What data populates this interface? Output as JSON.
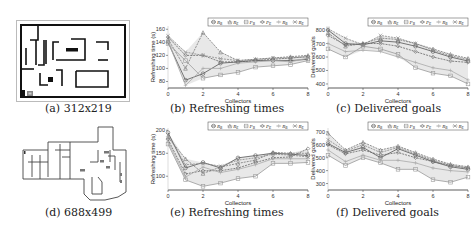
{
  "figure": {
    "panels": [
      {
        "id": "a",
        "caption": "(a) 312x219",
        "type": "map"
      },
      {
        "id": "b",
        "caption": "(b) Refreshing times",
        "type": "chart"
      },
      {
        "id": "c",
        "caption": "(c) Delivered goals",
        "type": "chart"
      },
      {
        "id": "d",
        "caption": "(d) 688x499",
        "type": "map"
      },
      {
        "id": "e",
        "caption": "(e) Refreshing times",
        "type": "chart"
      },
      {
        "id": "f",
        "caption": "(f) Delivered goals",
        "type": "chart"
      }
    ]
  },
  "legend": {
    "entries": [
      "R_B",
      "R_E",
      "P_B",
      "P_E",
      "R_B",
      "R_E"
    ],
    "display": [
      "R",
      "R",
      "P",
      "P",
      "R",
      "R"
    ],
    "subs": [
      "B",
      "E",
      "B",
      "E",
      "B",
      "E"
    ],
    "markers": [
      "circle",
      "triangle",
      "square",
      "diamond",
      "plus",
      "cross"
    ]
  },
  "colors": {
    "axis": "#333333",
    "band": "#bdbdbd",
    "series": [
      "#555555",
      "#777777",
      "#999999",
      "#666666",
      "#aaaaaa",
      "#888888"
    ]
  },
  "chart_data": [
    {
      "id": "b",
      "type": "line",
      "title": "Refreshing times",
      "xlabel": "Collectors",
      "ylabel": "Refreshing time (s)",
      "x": [
        0,
        1,
        2,
        3,
        4,
        5,
        6,
        7,
        8
      ],
      "xticks": [
        0,
        2,
        4,
        6,
        8
      ],
      "yticks": [
        80,
        100,
        120,
        140,
        160
      ],
      "ylim": [
        70,
        165
      ],
      "legend_position": "top-right",
      "grid": false,
      "series": [
        {
          "name": "R_B",
          "values": [
            140,
            82,
            92,
            108,
            110,
            112,
            112,
            112,
            114
          ]
        },
        {
          "name": "R_E",
          "values": [
            145,
            100,
            155,
            125,
            112,
            114,
            116,
            118,
            120
          ]
        },
        {
          "name": "P_B",
          "values": [
            138,
            112,
            85,
            90,
            94,
            102,
            104,
            106,
            112
          ]
        },
        {
          "name": "P_E",
          "values": [
            148,
            120,
            120,
            110,
            110,
            112,
            114,
            116,
            118
          ]
        },
        {
          "name": "R_B",
          "values": [
            142,
            74,
            100,
            100,
            108,
            110,
            112,
            110,
            116
          ]
        },
        {
          "name": "R_E",
          "values": [
            150,
            125,
            120,
            115,
            112,
            114,
            116,
            116,
            118
          ]
        }
      ]
    },
    {
      "id": "c",
      "type": "line",
      "title": "Delivered goals",
      "xlabel": "Collectors",
      "ylabel": "Delivered goals",
      "x": [
        0,
        1,
        2,
        3,
        4,
        5,
        6,
        7,
        8
      ],
      "xticks": [
        0,
        2,
        4,
        6,
        8
      ],
      "yticks": [
        400,
        500,
        600,
        700,
        800
      ],
      "ylim": [
        370,
        830
      ],
      "legend_position": "top-right",
      "grid": false,
      "series": [
        {
          "name": "R_B",
          "values": [
            800,
            700,
            690,
            720,
            710,
            680,
            640,
            600,
            570
          ]
        },
        {
          "name": "R_E",
          "values": [
            780,
            680,
            700,
            740,
            730,
            700,
            660,
            620,
            590
          ]
        },
        {
          "name": "P_B",
          "values": [
            660,
            600,
            680,
            660,
            620,
            520,
            480,
            460,
            400
          ]
        },
        {
          "name": "P_E",
          "values": [
            760,
            690,
            700,
            700,
            680,
            640,
            600,
            570,
            560
          ]
        },
        {
          "name": "R_B",
          "values": [
            700,
            640,
            650,
            640,
            600,
            560,
            520,
            500,
            430
          ]
        },
        {
          "name": "R_E",
          "values": [
            810,
            740,
            690,
            760,
            740,
            700,
            650,
            610,
            580
          ]
        }
      ]
    },
    {
      "id": "e",
      "type": "line",
      "title": "Refreshing times",
      "xlabel": "Collectors",
      "ylabel": "Refreshing time (s)",
      "x": [
        0,
        1,
        2,
        3,
        4,
        5,
        6,
        7,
        8
      ],
      "xticks": [
        0,
        2,
        4,
        6,
        8
      ],
      "yticks": [
        100,
        150,
        200
      ],
      "ylim": [
        70,
        205
      ],
      "legend_position": "top-right",
      "grid": false,
      "series": [
        {
          "name": "R_B",
          "values": [
            195,
            118,
            130,
            118,
            140,
            145,
            150,
            148,
            145
          ]
        },
        {
          "name": "R_E",
          "values": [
            185,
            138,
            106,
            120,
            128,
            135,
            152,
            150,
            150
          ]
        },
        {
          "name": "P_B",
          "values": [
            170,
            92,
            78,
            85,
            95,
            100,
            128,
            128,
            130
          ]
        },
        {
          "name": "P_E",
          "values": [
            180,
            105,
            112,
            112,
            118,
            130,
            140,
            142,
            160
          ]
        },
        {
          "name": "R_B",
          "values": [
            175,
            98,
            120,
            108,
            115,
            125,
            138,
            138,
            138
          ]
        },
        {
          "name": "R_E",
          "values": [
            190,
            125,
            128,
            122,
            135,
            140,
            148,
            146,
            142
          ]
        }
      ]
    },
    {
      "id": "f",
      "type": "line",
      "title": "Delivered goals",
      "xlabel": "Collectors",
      "ylabel": "Delivered goals",
      "x": [
        0,
        1,
        2,
        3,
        4,
        5,
        6,
        7,
        8
      ],
      "xticks": [
        0,
        2,
        4,
        6,
        8
      ],
      "yticks": [
        300,
        400,
        500,
        600,
        700
      ],
      "ylim": [
        250,
        730
      ],
      "legend_position": "top-right",
      "grid": false,
      "series": [
        {
          "name": "R_B",
          "values": [
            610,
            540,
            580,
            500,
            570,
            520,
            470,
            430,
            410
          ]
        },
        {
          "name": "R_E",
          "values": [
            690,
            560,
            620,
            560,
            590,
            540,
            490,
            450,
            430
          ]
        },
        {
          "name": "P_B",
          "values": [
            520,
            440,
            500,
            460,
            410,
            410,
            330,
            310,
            350
          ]
        },
        {
          "name": "P_E",
          "values": [
            600,
            530,
            560,
            520,
            540,
            500,
            470,
            440,
            420
          ]
        },
        {
          "name": "R_B",
          "values": [
            560,
            470,
            520,
            480,
            480,
            460,
            420,
            400,
            390
          ]
        },
        {
          "name": "R_E",
          "values": [
            640,
            550,
            600,
            540,
            580,
            530,
            480,
            440,
            420
          ]
        }
      ]
    }
  ]
}
